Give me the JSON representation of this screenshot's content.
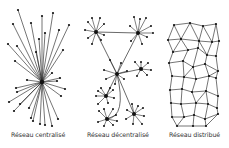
{
  "figure": {
    "panels": [
      {
        "label": "Réseau centralisé",
        "type": "centralized",
        "hub": [
          42,
          82
        ],
        "leaves": [
          [
            18,
            10
          ],
          [
            13,
            24
          ],
          [
            42,
            16
          ],
          [
            53,
            13
          ],
          [
            31,
            23
          ],
          [
            69,
            25
          ],
          [
            8,
            44
          ],
          [
            17,
            46
          ],
          [
            45,
            33
          ],
          [
            39,
            39
          ],
          [
            59,
            30
          ],
          [
            63,
            50
          ],
          [
            36,
            52
          ],
          [
            15,
            61
          ],
          [
            27,
            80
          ],
          [
            16,
            88
          ],
          [
            17,
            92
          ],
          [
            9,
            102
          ],
          [
            14,
            111
          ],
          [
            20,
            104
          ],
          [
            29,
            108
          ],
          [
            31,
            118
          ],
          [
            40,
            124
          ],
          [
            33,
            121
          ],
          [
            45,
            125
          ],
          [
            52,
            126
          ],
          [
            58,
            119
          ],
          [
            61,
            96
          ],
          [
            57,
            81
          ],
          [
            52,
            73
          ],
          [
            60,
            78
          ],
          [
            65,
            89
          ]
        ]
      },
      {
        "label": "Réseau décentralisé",
        "type": "decentralized",
        "hubs": [
          {
            "c": [
              96,
              32
            ],
            "leaves": [
              [
                88,
                22
              ],
              [
                92,
                18
              ],
              [
                100,
                18
              ],
              [
                104,
                24
              ],
              [
                85,
                30
              ],
              [
                88,
                38
              ],
              [
                92,
                44
              ],
              [
                101,
                40
              ],
              [
                104,
                35
              ]
            ]
          },
          {
            "c": [
              138,
              33
            ],
            "leaves": [
              [
                134,
                17
              ],
              [
                140,
                19
              ],
              [
                146,
                18
              ],
              [
                151,
                26
              ],
              [
                153,
                33
              ],
              [
                147,
                37
              ],
              [
                142,
                44
              ],
              [
                131,
                41
              ],
              [
                130,
                26
              ]
            ]
          },
          {
            "c": [
              117,
              74
            ],
            "leaves": [
              [
                104,
                70
              ],
              [
                106,
                79
              ],
              [
                115,
                84
              ],
              [
                110,
                60
              ],
              [
                121,
                63
              ],
              [
                124,
                79
              ],
              [
                127,
                71
              ]
            ]
          },
          {
            "c": [
              141,
              69
            ],
            "leaves": [
              [
                135,
                62
              ],
              [
                141,
                62
              ],
              [
                148,
                63
              ],
              [
                151,
                70
              ],
              [
                147,
                75
              ],
              [
                137,
                76
              ]
            ]
          },
          {
            "c": [
              106,
              96
            ],
            "leaves": [
              [
                98,
                91
              ],
              [
                101,
                88
              ],
              [
                110,
                88
              ],
              [
                113,
                90
              ],
              [
                114,
                98
              ],
              [
                108,
                103
              ],
              [
                98,
                104
              ],
              [
                96,
                96
              ]
            ]
          },
          {
            "c": [
              107,
              119
            ],
            "leaves": [
              [
                99,
                111
              ],
              [
                104,
                109
              ],
              [
                113,
                109
              ],
              [
                116,
                115
              ],
              [
                117,
                121
              ],
              [
                113,
                125
              ],
              [
                104,
                126
              ],
              [
                98,
                122
              ]
            ]
          },
          {
            "c": [
              134,
              114
            ],
            "leaves": [
              [
                127,
                110
              ],
              [
                132,
                104
              ],
              [
                138,
                106
              ],
              [
                143,
                108
              ],
              [
                144,
                116
              ],
              [
                142,
                124
              ],
              [
                133,
                124
              ],
              [
                126,
                119
              ]
            ]
          }
        ],
        "links": [
          [
            0,
            1
          ],
          [
            0,
            2
          ],
          [
            1,
            2
          ],
          [
            2,
            3
          ],
          [
            2,
            4
          ],
          [
            2,
            6
          ]
        ],
        "curved_links": [
          [
            2,
            5
          ]
        ]
      },
      {
        "label": "Réseau distribué",
        "type": "distributed",
        "nodes": [
          [
            174,
            25
          ],
          [
            190,
            23
          ],
          [
            203,
            26
          ],
          [
            216,
            24
          ],
          [
            168,
            40
          ],
          [
            181,
            39
          ],
          [
            199,
            41
          ],
          [
            212,
            42
          ],
          [
            219,
            41
          ],
          [
            173,
            52
          ],
          [
            188,
            50
          ],
          [
            198,
            48
          ],
          [
            207,
            55
          ],
          [
            216,
            56
          ],
          [
            169,
            63
          ],
          [
            183,
            61
          ],
          [
            193,
            67
          ],
          [
            205,
            64
          ],
          [
            218,
            71
          ],
          [
            172,
            76
          ],
          [
            184,
            77
          ],
          [
            196,
            79
          ],
          [
            209,
            76
          ],
          [
            216,
            78
          ],
          [
            170,
            90
          ],
          [
            182,
            89
          ],
          [
            192,
            92
          ],
          [
            206,
            91
          ],
          [
            218,
            96
          ],
          [
            171,
            103
          ],
          [
            181,
            104
          ],
          [
            196,
            103
          ],
          [
            208,
            104
          ],
          [
            217,
            108
          ],
          [
            172,
            117
          ],
          [
            184,
            117
          ],
          [
            194,
            115
          ],
          [
            205,
            119
          ],
          [
            218,
            114
          ],
          [
            177,
            126
          ],
          [
            193,
            126
          ],
          [
            206,
            126
          ]
        ],
        "edges": [
          [
            0,
            1
          ],
          [
            1,
            2
          ],
          [
            2,
            3
          ],
          [
            0,
            4
          ],
          [
            0,
            5
          ],
          [
            1,
            5
          ],
          [
            1,
            6
          ],
          [
            2,
            6
          ],
          [
            2,
            7
          ],
          [
            3,
            7
          ],
          [
            3,
            8
          ],
          [
            4,
            5
          ],
          [
            5,
            6
          ],
          [
            6,
            7
          ],
          [
            7,
            8
          ],
          [
            4,
            9
          ],
          [
            5,
            9
          ],
          [
            5,
            10
          ],
          [
            6,
            11
          ],
          [
            6,
            12
          ],
          [
            7,
            12
          ],
          [
            8,
            13
          ],
          [
            9,
            10
          ],
          [
            10,
            11
          ],
          [
            11,
            12
          ],
          [
            12,
            13
          ],
          [
            9,
            14
          ],
          [
            10,
            15
          ],
          [
            11,
            16
          ],
          [
            12,
            17
          ],
          [
            13,
            18
          ],
          [
            14,
            15
          ],
          [
            15,
            16
          ],
          [
            16,
            17
          ],
          [
            17,
            18
          ],
          [
            14,
            19
          ],
          [
            15,
            20
          ],
          [
            16,
            20
          ],
          [
            16,
            21
          ],
          [
            17,
            22
          ],
          [
            18,
            22
          ],
          [
            18,
            23
          ],
          [
            19,
            20
          ],
          [
            20,
            21
          ],
          [
            21,
            22
          ],
          [
            22,
            23
          ],
          [
            19,
            24
          ],
          [
            20,
            25
          ],
          [
            21,
            26
          ],
          [
            22,
            27
          ],
          [
            23,
            28
          ],
          [
            24,
            25
          ],
          [
            25,
            26
          ],
          [
            26,
            27
          ],
          [
            27,
            28
          ],
          [
            24,
            29
          ],
          [
            25,
            30
          ],
          [
            26,
            31
          ],
          [
            27,
            31
          ],
          [
            27,
            32
          ],
          [
            28,
            33
          ],
          [
            29,
            30
          ],
          [
            30,
            31
          ],
          [
            31,
            32
          ],
          [
            32,
            33
          ],
          [
            29,
            34
          ],
          [
            30,
            35
          ],
          [
            31,
            36
          ],
          [
            32,
            37
          ],
          [
            33,
            38
          ],
          [
            34,
            35
          ],
          [
            35,
            36
          ],
          [
            36,
            37
          ],
          [
            37,
            38
          ],
          [
            34,
            39
          ],
          [
            35,
            39
          ],
          [
            36,
            40
          ],
          [
            37,
            41
          ],
          [
            38,
            41
          ],
          [
            39,
            40
          ],
          [
            40,
            41
          ]
        ]
      }
    ]
  },
  "style": {
    "line_color": "#2a2a2a",
    "node_color": "#111111",
    "background": "#ffffff"
  }
}
